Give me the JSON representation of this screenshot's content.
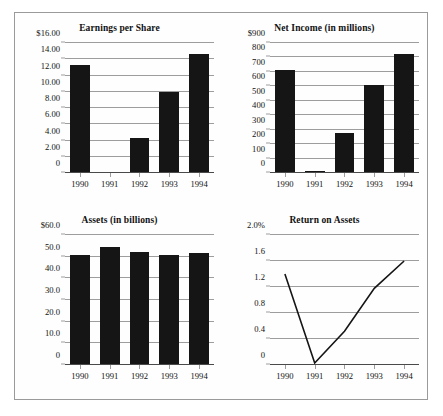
{
  "figure": {
    "background_color": "#fefefe",
    "border_color": "#9a9a9a",
    "bar_color": "#151515",
    "grid_color": "#9d9d9d"
  },
  "chart_data": [
    {
      "id": "earnings-per-share",
      "type": "bar",
      "title": "Earnings per Share",
      "xlabel": "",
      "ylabel": "",
      "categories": [
        "1990",
        "1991",
        "1992",
        "1993",
        "1994"
      ],
      "values": [
        13.25,
        0.0,
        4.3,
        10.0,
        14.7
      ],
      "ylim": [
        0,
        16
      ],
      "yticks": [
        0,
        2,
        4,
        6,
        8,
        10,
        12,
        14,
        16
      ],
      "ytick_labels": [
        "0",
        "2.00",
        "4.00",
        "6.00",
        "8.00",
        "10.00",
        "12.00",
        "14.00",
        "$16.00"
      ],
      "grid": true,
      "legend": "none"
    },
    {
      "id": "net-income",
      "type": "bar",
      "title": "Net Income (in millions)",
      "xlabel": "",
      "ylabel": "",
      "categories": [
        "1990",
        "1991",
        "1992",
        "1993",
        "1994"
      ],
      "values": [
        715,
        12,
        278,
        608,
        825
      ],
      "ylim": [
        0,
        900
      ],
      "yticks": [
        0,
        100,
        200,
        300,
        400,
        500,
        600,
        700,
        800,
        900
      ],
      "ytick_labels": [
        "0",
        "100",
        "200",
        "300",
        "400",
        "500",
        "600",
        "700",
        "800",
        "$900"
      ],
      "grid": true,
      "legend": "none"
    },
    {
      "id": "assets",
      "type": "bar",
      "title": "Assets (in billions)",
      "xlabel": "",
      "ylabel": "",
      "categories": [
        "1990",
        "1991",
        "1992",
        "1993",
        "1994"
      ],
      "values": [
        51.0,
        54.5,
        52.3,
        51.0,
        51.5
      ],
      "ylim": [
        0,
        60
      ],
      "yticks": [
        0,
        10,
        20,
        30,
        40,
        50,
        60
      ],
      "ytick_labels": [
        "0",
        "10.0",
        "20.0",
        "30.0",
        "40.0",
        "50.0",
        "$60.0"
      ],
      "grid": true,
      "legend": "none"
    },
    {
      "id": "return-on-assets",
      "type": "line",
      "title": "Return on Assets",
      "xlabel": "",
      "ylabel": "",
      "categories": [
        "1990",
        "1991",
        "1992",
        "1993",
        "1994"
      ],
      "values": [
        1.4,
        0.03,
        0.52,
        1.18,
        1.6
      ],
      "ylim": [
        0,
        2.0
      ],
      "yticks": [
        0,
        0.4,
        0.8,
        1.2,
        1.6,
        2.0
      ],
      "ytick_labels": [
        "0",
        "0.4",
        "0.8",
        "1.2",
        "1.6",
        "2.0%"
      ],
      "grid": true,
      "legend": "none",
      "line_color": "#151515"
    }
  ]
}
